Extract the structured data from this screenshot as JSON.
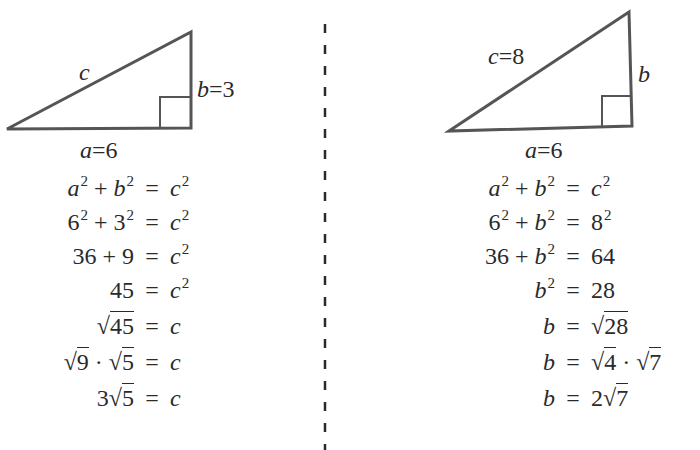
{
  "figure": {
    "divider": {
      "style": "dashed",
      "color": "#2a2a2a"
    },
    "left": {
      "triangle": {
        "hyp_label": "c",
        "vertical_label": "b=3",
        "base_label": "a=6"
      },
      "steps": [
        {
          "lhs": "a² + b²",
          "rhs": "c²"
        },
        {
          "lhs": "6² + 3²",
          "rhs": "c²"
        },
        {
          "lhs": "36 + 9",
          "rhs": "c²"
        },
        {
          "lhs": "45",
          "rhs": "c²"
        },
        {
          "lhs": "√45",
          "rhs": "c"
        },
        {
          "lhs": "√9 · √5",
          "rhs": "c"
        },
        {
          "lhs": "3√5",
          "rhs": "c"
        }
      ]
    },
    "right": {
      "triangle": {
        "hyp_label": "c=8",
        "vertical_label": "b",
        "base_label": "a=6"
      },
      "steps": [
        {
          "lhs": "a² + b²",
          "rhs": "c²"
        },
        {
          "lhs": "6² + b²",
          "rhs": "8²"
        },
        {
          "lhs": "36 + b²",
          "rhs": "64"
        },
        {
          "lhs": "b²",
          "rhs": "28"
        },
        {
          "lhs": "b",
          "rhs": "√28"
        },
        {
          "lhs": "b",
          "rhs": "√4 · √7"
        },
        {
          "lhs": "b",
          "rhs": "2√7"
        }
      ]
    },
    "symbols": {
      "eq": "=",
      "plus": "+",
      "dot": "·",
      "sqrt": "√",
      "sq": "2"
    },
    "parts": {
      "a": "a",
      "b": "b",
      "c": "c",
      "n3": "3",
      "n6": "6",
      "n8": "8",
      "n9": "9",
      "n36": "36",
      "n45": "45",
      "n5": "5",
      "n64": "64",
      "n28": "28",
      "n4": "4",
      "n7": "7",
      "n2": "2"
    }
  }
}
